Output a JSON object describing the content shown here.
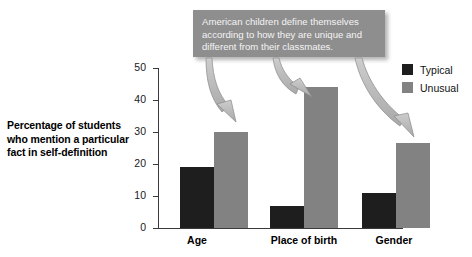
{
  "chart_data": {
    "type": "bar",
    "title": "",
    "xlabel": "",
    "ylabel": "Percentage of students who mention a particular fact in self-definition",
    "ylabel_lines": [
      "Percentage of students",
      "who mention a particular",
      "fact in self-definition"
    ],
    "categories": [
      "Age",
      "Place of birth",
      "Gender"
    ],
    "series": [
      {
        "name": "Typical",
        "color": "#1e1e1e",
        "values": [
          19,
          7,
          11
        ]
      },
      {
        "name": "Unusual",
        "color": "#828282",
        "values": [
          30,
          44,
          26.5
        ]
      }
    ],
    "ylim": [
      0,
      50
    ],
    "yticks": [
      0,
      10,
      20,
      30,
      40,
      50
    ],
    "ytick_labels": [
      "0",
      "10",
      "20",
      "30",
      "40",
      "50"
    ],
    "grid": false,
    "legend_position": "right-top",
    "annotations": [
      {
        "text": "American children define themselves according to how they are unique and different from their classmates.",
        "lines": [
          "American children define themselves",
          "according to how they are unique and",
          "different from their classmates."
        ],
        "points_to": [
          "Age / Unusual",
          "Place of birth / Unusual",
          "Gender / Unusual"
        ]
      }
    ]
  },
  "legend": {
    "items": [
      {
        "label": "Typical",
        "color": "#1e1e1e"
      },
      {
        "label": "Unusual",
        "color": "#828282"
      }
    ]
  },
  "colors": {
    "typical": "#1e1e1e",
    "unusual": "#828282",
    "callout_background": "#8e8e8e",
    "callout_text": "#f4f4f4",
    "axis": "#3a3a3a",
    "arrow_fill": "#b5b5b5",
    "arrow_stroke": "#7d7d7d"
  }
}
